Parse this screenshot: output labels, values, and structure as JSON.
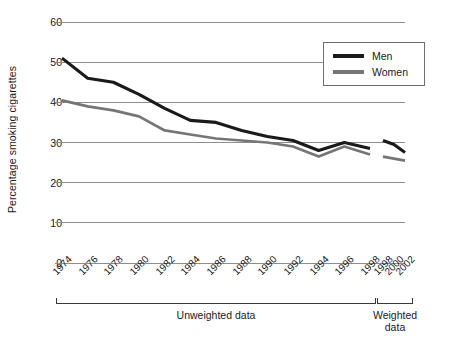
{
  "chart_data": {
    "type": "line",
    "title": "",
    "xlabel": "",
    "ylabel": "Percentage smoking cigarettes",
    "ylim": [
      0,
      60
    ],
    "yticks": [
      0,
      10,
      20,
      30,
      40,
      50,
      60
    ],
    "grid": true,
    "legend_position": "top-right",
    "legend": [
      "Men",
      "Women"
    ],
    "groups": [
      {
        "label_line1": "Unweighted data",
        "label_line2": ""
      },
      {
        "label_line1": "Weighted",
        "label_line2": "data"
      }
    ],
    "categories": [
      "1974",
      "1976",
      "1978",
      "1980",
      "1982",
      "1984",
      "1986",
      "1988",
      "1990",
      "1992",
      "1994",
      "1996",
      "1998",
      "1998",
      "2000",
      "2002"
    ],
    "x_tick_labels": [
      "1974",
      "1976",
      "1978",
      "1980",
      "1982",
      "1984",
      "1986",
      "1988",
      "1990",
      "1992",
      "1994",
      "1996",
      "1998",
      "1998",
      "2000",
      "2002"
    ],
    "series": [
      {
        "name": "Men",
        "color": "#1a1a1a",
        "segments": [
          {
            "group": "Unweighted data",
            "x": [
              "1974",
              "1976",
              "1978",
              "1980",
              "1982",
              "1984",
              "1986",
              "1988",
              "1990",
              "1992",
              "1994",
              "1996",
              "1998"
            ],
            "values": [
              51,
              46,
              45,
              42,
              38.5,
              35.5,
              35,
              33,
              31.5,
              30.5,
              28,
              30,
              28.5
            ]
          },
          {
            "group": "Weighted data",
            "x": [
              "1998",
              "2000",
              "2002"
            ],
            "values": [
              30.5,
              29.5,
              27.5
            ]
          }
        ]
      },
      {
        "name": "Women",
        "color": "#767676",
        "segments": [
          {
            "group": "Unweighted data",
            "x": [
              "1974",
              "1976",
              "1978",
              "1980",
              "1982",
              "1984",
              "1986",
              "1988",
              "1990",
              "1992",
              "1994",
              "1996",
              "1998"
            ],
            "values": [
              40.5,
              39,
              38,
              36.5,
              33,
              32,
              31,
              30.5,
              30,
              29,
              26.5,
              29,
              27
            ]
          },
          {
            "group": "Weighted data",
            "x": [
              "1998",
              "2000",
              "2002"
            ],
            "values": [
              26.5,
              26,
              25.5
            ]
          }
        ]
      }
    ]
  },
  "axis": {
    "y_title": "Percentage smoking cigarettes",
    "y_labels": [
      "60",
      "50",
      "40",
      "30",
      "20",
      "10",
      "0"
    ]
  },
  "legend": {
    "men_label": "Men",
    "women_label": "Women",
    "men_color": "#1a1a1a",
    "women_color": "#767676"
  },
  "brackets": {
    "unweighted_label": "Unweighted data",
    "weighted_label_line1": "Weighted",
    "weighted_label_line2": "data"
  }
}
